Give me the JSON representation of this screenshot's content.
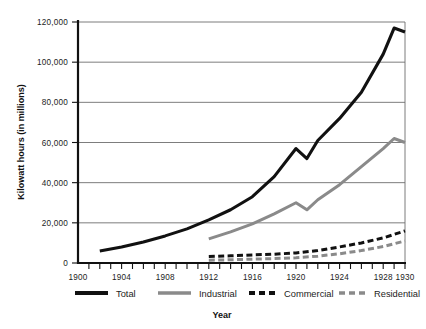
{
  "chart_data": {
    "type": "line",
    "title": "",
    "xlabel": "Year",
    "ylabel": "Kilowatt hours (in millions)",
    "xlim": [
      1900,
      1930
    ],
    "ylim": [
      0,
      120000
    ],
    "grid": true,
    "legend_position": "bottom",
    "xticks": [
      "1900",
      "1904",
      "1908",
      "1912",
      "1916",
      "1920",
      "1924",
      "1928",
      "1930"
    ],
    "xtick_values": [
      1900,
      1904,
      1908,
      1912,
      1916,
      1920,
      1924,
      1928,
      1930
    ],
    "yticks": [
      "0",
      "20,000",
      "40,000",
      "60,000",
      "80,000",
      "100,000",
      "120,000"
    ],
    "ytick_values": [
      0,
      20000,
      40000,
      60000,
      80000,
      100000,
      120000
    ],
    "series": [
      {
        "name": "Total",
        "style": "solid",
        "color": "#111111",
        "x": [
          1902,
          1904,
          1906,
          1908,
          1910,
          1912,
          1914,
          1916,
          1918,
          1920,
          1921,
          1922,
          1924,
          1926,
          1928,
          1929,
          1930
        ],
        "values": [
          6000,
          8000,
          10500,
          13500,
          17000,
          21500,
          26500,
          33000,
          43000,
          57000,
          52000,
          61000,
          72000,
          85000,
          104000,
          117000,
          115000
        ]
      },
      {
        "name": "Industrial",
        "style": "solid",
        "color": "#8a8a8a",
        "x": [
          1912,
          1914,
          1916,
          1918,
          1920,
          1921,
          1922,
          1924,
          1926,
          1928,
          1929,
          1930
        ],
        "values": [
          12000,
          15500,
          19500,
          24500,
          30000,
          26500,
          31500,
          39000,
          48000,
          57000,
          62000,
          60000
        ]
      },
      {
        "name": "Commercial",
        "style": "dashed",
        "color": "#111111",
        "x": [
          1912,
          1914,
          1916,
          1918,
          1920,
          1922,
          1924,
          1926,
          1928,
          1930
        ],
        "values": [
          3200,
          3600,
          4000,
          4400,
          5000,
          6200,
          8000,
          10000,
          12500,
          16000
        ]
      },
      {
        "name": "Residential",
        "style": "dashed",
        "color": "#8a8a8a",
        "x": [
          1912,
          1914,
          1916,
          1918,
          1920,
          1922,
          1924,
          1926,
          1928,
          1930
        ],
        "values": [
          1400,
          1600,
          1900,
          2200,
          2600,
          3400,
          4600,
          6200,
          8200,
          11000
        ]
      }
    ]
  },
  "legend": {
    "items": [
      {
        "label": "Total"
      },
      {
        "label": "Industrial"
      },
      {
        "label": "Commercial"
      },
      {
        "label": "Residential"
      }
    ]
  },
  "colors": {
    "total": "#111111",
    "industrial": "#8a8a8a",
    "commercial": "#111111",
    "residential": "#8a8a8a",
    "grid": "#6e6e6e",
    "axis": "#111111"
  }
}
